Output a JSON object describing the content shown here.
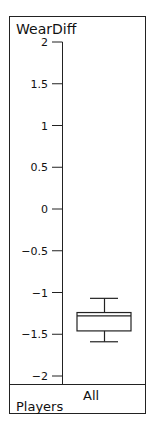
{
  "chart_data": {
    "type": "boxplot",
    "title": "WearDiff",
    "ylabel": "WearDiff",
    "xlabel": "",
    "ylim": [
      -2,
      2
    ],
    "yticks": [
      "2",
      "1.5",
      "1",
      "0.5",
      "0",
      "−0.5",
      "−1",
      "−1.5",
      "−2"
    ],
    "ytick_values": [
      2,
      1.5,
      1,
      0.5,
      0,
      -0.5,
      -1,
      -1.5,
      -2
    ],
    "categories": [
      "All Players"
    ],
    "category_label_lines": [
      "All",
      "Players"
    ],
    "series": [
      {
        "name": "All Players",
        "whisker_high": -1.07,
        "q3": -1.24,
        "median": -1.28,
        "q1": -1.46,
        "whisker_low": -1.59
      }
    ],
    "grid": false,
    "legend": "none"
  },
  "colors": {
    "line": "#222222",
    "background": "#ffffff"
  }
}
